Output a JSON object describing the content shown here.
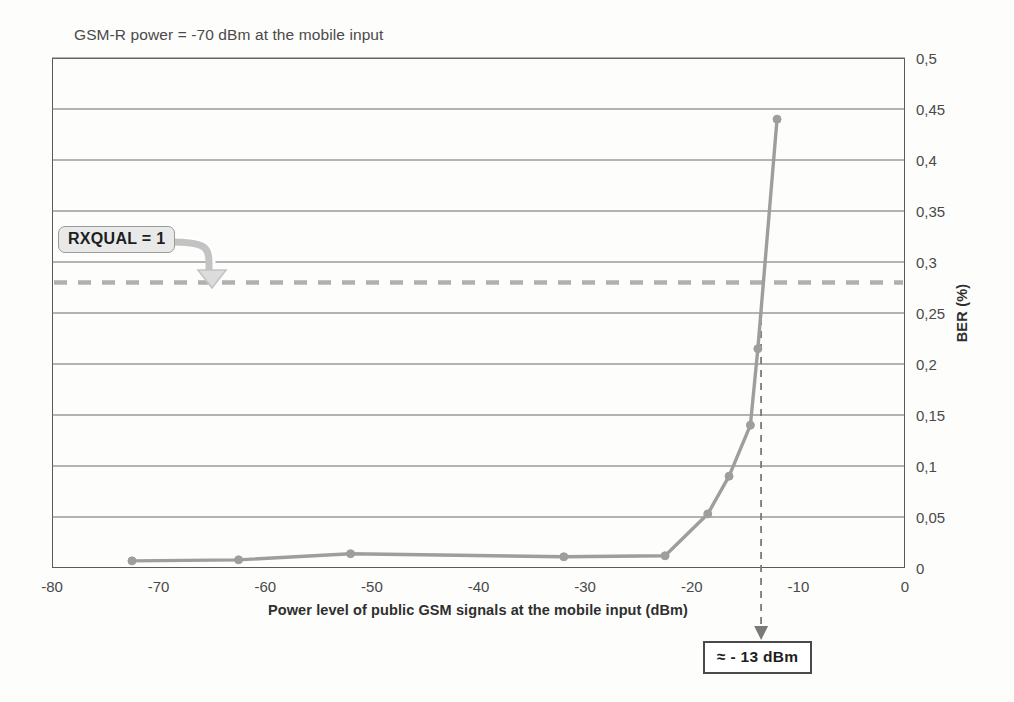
{
  "chart_data": {
    "type": "line",
    "title": "GSM-R power = -70 dBm at the mobile input",
    "xlabel": "Power level of public GSM signals at the mobile input (dBm)",
    "ylabel": "BER (%)",
    "xlim": [
      -80,
      0
    ],
    "ylim": [
      0,
      0.5
    ],
    "grid": "horizontal",
    "legend": "none",
    "xticks": [
      "-80",
      "-70",
      "-60",
      "-50",
      "-40",
      "-30",
      "-20",
      "-10",
      "0"
    ],
    "xtick_values": [
      -80,
      -70,
      -60,
      -50,
      -40,
      -30,
      -20,
      -10,
      0
    ],
    "yticks": [
      "0",
      "0,05",
      "0,1",
      "0,15",
      "0,2",
      "0,25",
      "0,3",
      "0,35",
      "0,4",
      "0,45",
      "0,5"
    ],
    "ytick_values": [
      0,
      0.05,
      0.1,
      0.15,
      0.2,
      0.25,
      0.3,
      0.35,
      0.4,
      0.45,
      0.5
    ],
    "series": [
      {
        "name": "BER vs public GSM power",
        "color": "#9e9e9e",
        "marker": "circle",
        "x": [
          -72.5,
          -62.5,
          -52,
          -32,
          -22.5,
          -18.5,
          -16.5,
          -14.5,
          -13.8,
          -12
        ],
        "y": [
          0.007,
          0.008,
          0.014,
          0.011,
          0.012,
          0.053,
          0.09,
          0.14,
          0.215,
          0.44
        ]
      }
    ],
    "threshold_line": {
      "name": "RXQUAL = 1",
      "orientation": "horizontal",
      "value": 0.28,
      "style": "dashed",
      "color": "#b0b0b0"
    },
    "marker_line": {
      "name": "approx -13 dBm",
      "orientation": "vertical",
      "value": -13.5,
      "style": "dashed",
      "color": "#7a7a7a"
    },
    "annotations": [
      {
        "name": "rxqual-callout",
        "text": "RXQUAL = 1"
      },
      {
        "name": "dbm-callout",
        "text": "≈ - 13 dBm"
      }
    ]
  },
  "colors": {
    "series": "#9e9e9e",
    "gridline": "#6b6b6b",
    "frame": "#5a5a5a",
    "threshold": "#b0b0b0",
    "marker_line": "#7a7a7a",
    "text": "#4a4a4a"
  }
}
